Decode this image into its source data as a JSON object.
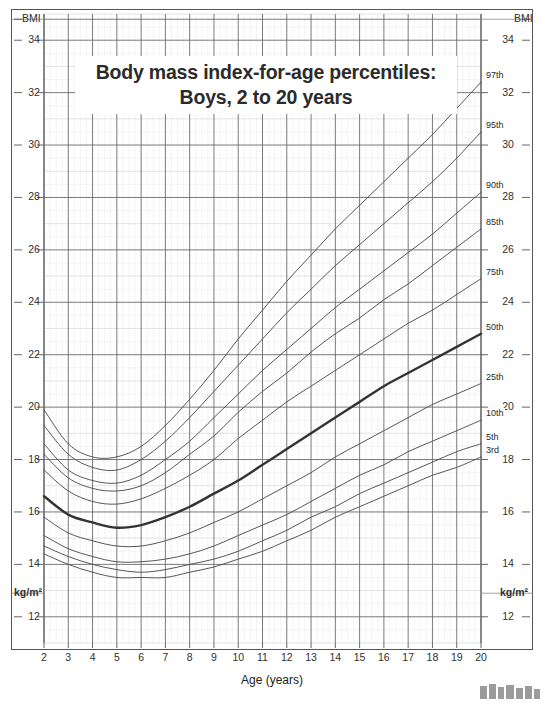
{
  "title": {
    "line1": "Body mass index-for-age percentiles:",
    "line2": "Boys, 2 to 20 years"
  },
  "axes": {
    "y_label_top_left": "BMI",
    "y_label_top_right": "BMI",
    "y_label_bottom_left": "kg/m²",
    "y_label_bottom_right": "kg/m²",
    "x_title": "Age (years)",
    "y_ticks": [
      34,
      32,
      30,
      28,
      26,
      24,
      22,
      20,
      18,
      16,
      14,
      12
    ],
    "x_ticks": [
      2,
      3,
      4,
      5,
      6,
      7,
      8,
      9,
      10,
      11,
      12,
      13,
      14,
      15,
      16,
      17,
      18,
      19,
      20
    ],
    "y_min": 11,
    "y_max": 35,
    "x_min": 2,
    "x_max": 20
  },
  "colors": {
    "grid_major": "#6b6b6b",
    "grid_minor": "#d9d9d9",
    "grid_faint": "#ececec",
    "curve": "#4d4d4d",
    "curve_bold": "#333333",
    "text": "#303030",
    "frame": "#555555",
    "background": "#ffffff"
  },
  "chart_data": {
    "type": "line",
    "title": "Body mass index-for-age percentiles: Boys, 2 to 20 years",
    "xlabel": "Age (years)",
    "ylabel": "BMI",
    "xlim": [
      2,
      20
    ],
    "ylim": [
      11,
      35
    ],
    "grid": true,
    "legend": "inline-right-end-labels",
    "x": [
      2,
      3,
      4,
      5,
      6,
      7,
      8,
      9,
      10,
      11,
      12,
      13,
      14,
      15,
      16,
      17,
      18,
      19,
      20
    ],
    "series": [
      {
        "name": "97th",
        "label": "97th",
        "values": [
          19.9,
          18.6,
          18.1,
          18.1,
          18.5,
          19.3,
          20.3,
          21.4,
          22.6,
          23.7,
          24.8,
          25.8,
          26.8,
          27.7,
          28.6,
          29.5,
          30.4,
          31.4,
          32.4
        ]
      },
      {
        "name": "95th",
        "label": "95th",
        "values": [
          19.3,
          18.2,
          17.7,
          17.6,
          18.0,
          18.7,
          19.6,
          20.6,
          21.6,
          22.6,
          23.6,
          24.5,
          25.4,
          26.2,
          27.0,
          27.8,
          28.6,
          29.5,
          30.5
        ]
      },
      {
        "name": "90th",
        "label": "90th",
        "values": [
          18.6,
          17.6,
          17.2,
          17.1,
          17.4,
          18.0,
          18.7,
          19.6,
          20.5,
          21.4,
          22.2,
          23.0,
          23.8,
          24.5,
          25.2,
          25.9,
          26.6,
          27.4,
          28.2
        ]
      },
      {
        "name": "85th",
        "label": "85th",
        "values": [
          18.2,
          17.3,
          16.9,
          16.8,
          17.0,
          17.5,
          18.2,
          18.9,
          19.8,
          20.6,
          21.3,
          22.1,
          22.8,
          23.4,
          24.1,
          24.7,
          25.4,
          26.1,
          26.8
        ]
      },
      {
        "name": "75th",
        "label": "75th",
        "values": [
          17.6,
          16.8,
          16.4,
          16.3,
          16.5,
          16.9,
          17.4,
          18.0,
          18.8,
          19.5,
          20.2,
          20.8,
          21.4,
          22.0,
          22.6,
          23.2,
          23.7,
          24.3,
          24.9
        ]
      },
      {
        "name": "50th",
        "label": "50th",
        "bold": true,
        "values": [
          16.6,
          15.9,
          15.6,
          15.4,
          15.5,
          15.8,
          16.2,
          16.7,
          17.2,
          17.8,
          18.4,
          19.0,
          19.6,
          20.2,
          20.8,
          21.3,
          21.8,
          22.3,
          22.8
        ]
      },
      {
        "name": "25th",
        "label": "25th",
        "values": [
          15.8,
          15.2,
          14.9,
          14.7,
          14.7,
          14.9,
          15.2,
          15.6,
          16.0,
          16.5,
          17.0,
          17.5,
          18.1,
          18.6,
          19.1,
          19.6,
          20.1,
          20.5,
          20.9
        ]
      },
      {
        "name": "10th",
        "label": "10th",
        "values": [
          15.1,
          14.6,
          14.3,
          14.1,
          14.1,
          14.2,
          14.4,
          14.7,
          15.1,
          15.5,
          15.9,
          16.4,
          16.9,
          17.4,
          17.8,
          18.3,
          18.7,
          19.1,
          19.5
        ]
      },
      {
        "name": "5th",
        "label": "5th",
        "values": [
          14.7,
          14.3,
          14.0,
          13.8,
          13.7,
          13.8,
          14.0,
          14.2,
          14.5,
          14.9,
          15.3,
          15.8,
          16.2,
          16.7,
          17.1,
          17.5,
          17.9,
          18.3,
          18.6
        ]
      },
      {
        "name": "3rd",
        "label": "3rd",
        "values": [
          14.4,
          14.0,
          13.7,
          13.5,
          13.5,
          13.5,
          13.7,
          13.9,
          14.2,
          14.5,
          14.9,
          15.3,
          15.8,
          16.2,
          16.6,
          17.0,
          17.4,
          17.7,
          18.1
        ]
      }
    ]
  }
}
